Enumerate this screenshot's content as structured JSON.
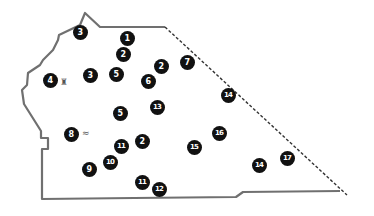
{
  "map": {
    "boundary_color": "#707070",
    "boundary_solid_points": "340,191 243,192 236,197 134,198 42,199 42,149 48,149 48,138 41,138 41,131 24,104 22,90 27,85 28,73 40,65 43,60 53,50 58,40 59,35 80,25 85,13 100,27 154,27 165,27",
    "boundary_dashed_points": "165,27 347,195",
    "marker_fill": "#111111",
    "marker_text": "#ffffff"
  },
  "markers": [
    {
      "label": "1",
      "x": 127,
      "y": 38
    },
    {
      "label": "2",
      "x": 123,
      "y": 54
    },
    {
      "label": "3",
      "x": 80,
      "y": 32
    },
    {
      "label": "2",
      "x": 161,
      "y": 66
    },
    {
      "label": "7",
      "x": 187,
      "y": 62
    },
    {
      "label": "4",
      "x": 50,
      "y": 80
    },
    {
      "label": "3",
      "x": 90,
      "y": 75
    },
    {
      "label": "5",
      "x": 116,
      "y": 74
    },
    {
      "label": "6",
      "x": 148,
      "y": 81
    },
    {
      "label": "14",
      "x": 228,
      "y": 95
    },
    {
      "label": "5",
      "x": 120,
      "y": 113
    },
    {
      "label": "13",
      "x": 157,
      "y": 107
    },
    {
      "label": "8",
      "x": 71,
      "y": 134
    },
    {
      "label": "11",
      "x": 121,
      "y": 146
    },
    {
      "label": "2",
      "x": 142,
      "y": 141
    },
    {
      "label": "16",
      "x": 219,
      "y": 133
    },
    {
      "label": "15",
      "x": 194,
      "y": 147
    },
    {
      "label": "10",
      "x": 110,
      "y": 162
    },
    {
      "label": "9",
      "x": 89,
      "y": 169
    },
    {
      "label": "14",
      "x": 259,
      "y": 165
    },
    {
      "label": "17",
      "x": 287,
      "y": 158
    },
    {
      "label": "11",
      "x": 142,
      "y": 182
    },
    {
      "label": "12",
      "x": 159,
      "y": 189
    }
  ],
  "symbols": [
    {
      "name": "pin-symbol",
      "glyph": "♜",
      "x": 60,
      "y": 78
    },
    {
      "name": "wave-symbol",
      "glyph": "≈",
      "x": 82,
      "y": 129
    }
  ]
}
